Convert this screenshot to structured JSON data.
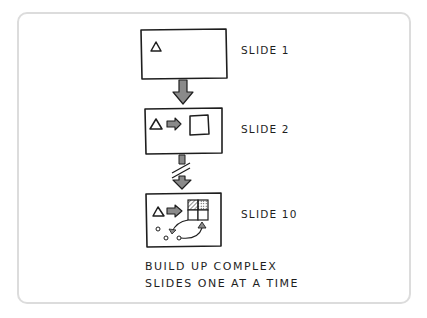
{
  "diagram": {
    "slides": [
      {
        "label": "SLIDE 1",
        "contents": [
          "triangle"
        ]
      },
      {
        "label": "SLIDE 2",
        "contents": [
          "triangle",
          "arrow",
          "square"
        ]
      },
      {
        "label": "SLIDE 10",
        "contents": [
          "triangle",
          "arrow",
          "grid-2x2 (hatched, dotted cells)",
          "circles",
          "curved-arrows",
          "small-triangle"
        ]
      }
    ],
    "connectors": [
      {
        "from": "SLIDE 1",
        "to": "SLIDE 2",
        "style": "solid-arrow"
      },
      {
        "from": "SLIDE 2",
        "to": "SLIDE 10",
        "style": "broken-arrow (skip)"
      }
    ],
    "caption_lines": [
      "BUILD UP COMPLEX",
      "SLIDES ONE AT A TIME"
    ],
    "colors": {
      "ink": "#1e1e1e",
      "arrow_fill": "#8a8a8a",
      "frame": "#dcdcdc"
    }
  }
}
